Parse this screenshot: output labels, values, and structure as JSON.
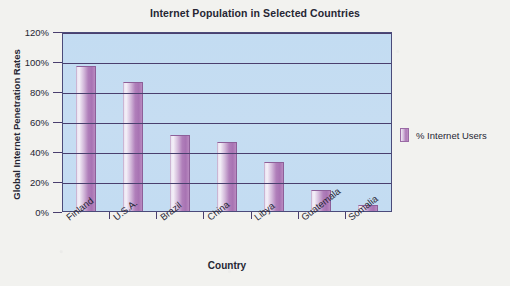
{
  "chart_data": {
    "type": "bar",
    "title": "Internet Population in Selected Countries",
    "xlabel": "Country",
    "ylabel": "Global Internet Penetration Rates",
    "categories": [
      "Finland",
      "U.S.A.",
      "Brazil",
      "China",
      "Libya",
      "Guatemala",
      "Somalia"
    ],
    "series": [
      {
        "name": "% Internet Users",
        "values": [
          97,
          86,
          51,
          46,
          33,
          14,
          4
        ]
      }
    ],
    "ylim": [
      0,
      120
    ],
    "ytick_labels": [
      "0%",
      "20%",
      "40%",
      "60%",
      "80%",
      "100%",
      "120%"
    ],
    "ytick_values": [
      0,
      20,
      40,
      60,
      80,
      100,
      120
    ],
    "grid": true,
    "legend_position": "right",
    "colors": {
      "bar": "#ad79b7",
      "plot_background": "#c5dcf2",
      "gridline": "#4a3f6e",
      "frame": "#4b4b7a",
      "page_background": "#f2f2ef",
      "text": "#262633"
    }
  },
  "legend": {
    "entries": [
      {
        "label": "% Internet Users",
        "swatch_name": "legend-swatch-internet-users"
      }
    ]
  }
}
